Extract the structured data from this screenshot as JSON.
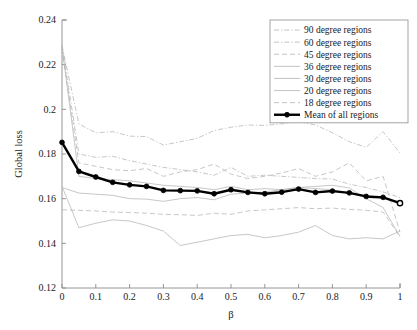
{
  "chart_data": {
    "type": "line",
    "title": "",
    "xlabel": "β",
    "ylabel": "Global loss",
    "xlim": [
      0,
      1
    ],
    "ylim": [
      0.12,
      0.24
    ],
    "xticks": [
      "0",
      "0.1",
      "0.2",
      "0.3",
      "0.4",
      "0.5",
      "0.6",
      "0.7",
      "0.8",
      "0.9",
      "1"
    ],
    "xtick_values": [
      0,
      0.1,
      0.2,
      0.3,
      0.4,
      0.5,
      0.6,
      0.7,
      0.8,
      0.9,
      1
    ],
    "yticks": [
      "0.12",
      "0.14",
      "0.16",
      "0.18",
      "0.2",
      "0.22",
      "0.24"
    ],
    "ytick_values": [
      0.12,
      0.14,
      0.16,
      0.18,
      0.2,
      0.22,
      0.24
    ],
    "grid": false,
    "legend_position": "top-right",
    "x": [
      0,
      0.05,
      0.1,
      0.15,
      0.2,
      0.25,
      0.3,
      0.35,
      0.4,
      0.45,
      0.5,
      0.55,
      0.6,
      0.65,
      0.7,
      0.75,
      0.8,
      0.85,
      0.9,
      0.95,
      1
    ],
    "series": [
      {
        "name": "90 degree regions",
        "style": "dashdot",
        "color": "#b4b4b4",
        "values": [
          0.2285,
          0.1935,
          0.1895,
          0.19,
          0.188,
          0.1878,
          0.184,
          0.1855,
          0.187,
          0.1905,
          0.192,
          0.193,
          0.1928,
          0.1935,
          0.1945,
          0.193,
          0.1895,
          0.1855,
          0.183,
          0.19,
          0.1805
        ]
      },
      {
        "name": "60 degree regions",
        "style": "dashdot",
        "color": "#bcbcbc",
        "values": [
          0.229,
          0.18,
          0.1785,
          0.179,
          0.177,
          0.1755,
          0.174,
          0.173,
          0.172,
          0.1705,
          0.174,
          0.17,
          0.1705,
          0.17,
          0.1695,
          0.169,
          0.1688,
          0.1665,
          0.165,
          0.163,
          0.1605
        ]
      },
      {
        "name": "45 degree regions",
        "style": "dashed",
        "color": "#b0b0b0",
        "values": [
          0.227,
          0.176,
          0.1745,
          0.173,
          0.1725,
          0.1735,
          0.17,
          0.172,
          0.173,
          0.1755,
          0.171,
          0.169,
          0.17,
          0.1715,
          0.1735,
          0.17,
          0.172,
          0.176,
          0.168,
          0.17,
          0.145
        ]
      },
      {
        "name": "36 degree regions",
        "style": "solid",
        "color": "#c4c4c4",
        "values": [
          0.228,
          0.17,
          0.169,
          0.1685,
          0.168,
          0.167,
          0.166,
          0.1655,
          0.165,
          0.164,
          0.1655,
          0.164,
          0.1645,
          0.164,
          0.165,
          0.1645,
          0.164,
          0.1625,
          0.1605,
          0.16,
          0.1585
        ]
      },
      {
        "name": "30 degree regions",
        "style": "solid",
        "color": "#a8a8a8",
        "values": [
          0.165,
          0.1625,
          0.162,
          0.1615,
          0.16,
          0.1598,
          0.1588,
          0.16,
          0.1605,
          0.1595,
          0.162,
          0.1625,
          0.163,
          0.164,
          0.165,
          0.1655,
          0.166,
          0.1648,
          0.16,
          0.156,
          0.143
        ]
      },
      {
        "name": "20 degree regions",
        "style": "solid",
        "color": "#cccccc",
        "values": [
          0.1655,
          0.147,
          0.149,
          0.1505,
          0.15,
          0.148,
          0.1455,
          0.139,
          0.1405,
          0.142,
          0.1435,
          0.144,
          0.1425,
          0.1435,
          0.145,
          0.148,
          0.1435,
          0.142,
          0.1425,
          0.142,
          0.1455
        ]
      },
      {
        "name": "18 degree regions",
        "style": "dashed",
        "color": "#9a9a9a",
        "values": [
          0.155,
          0.1548,
          0.1545,
          0.154,
          0.1538,
          0.1535,
          0.153,
          0.1528,
          0.1525,
          0.1535,
          0.153,
          0.1545,
          0.155,
          0.1555,
          0.156,
          0.1555,
          0.1558,
          0.1552,
          0.1548,
          0.154,
          0.143
        ]
      },
      {
        "name": "Mean of all regions",
        "style": "solid-thick-marker",
        "color": "#000000",
        "values": [
          0.1852,
          0.1722,
          0.1697,
          0.1673,
          0.1662,
          0.1655,
          0.1637,
          0.1636,
          0.1635,
          0.1622,
          0.164,
          0.1628,
          0.1622,
          0.1629,
          0.1643,
          0.1628,
          0.1634,
          0.1626,
          0.161,
          0.1606,
          0.158
        ]
      }
    ]
  },
  "legend": {
    "entries": [
      {
        "label": "90 degree regions"
      },
      {
        "label": "60 degree regions"
      },
      {
        "label": "45 degree regions"
      },
      {
        "label": "36 degree regions"
      },
      {
        "label": "30 degree regions"
      },
      {
        "label": "20 degree regions"
      },
      {
        "label": "18 degree regions"
      },
      {
        "label": "Mean of all regions"
      }
    ]
  },
  "colors": {
    "background": "#ffffff",
    "axis": "#8a8a8a",
    "region_line": "#b4b4b4",
    "mean_line": "#000000",
    "text": "#1a1a1a"
  }
}
